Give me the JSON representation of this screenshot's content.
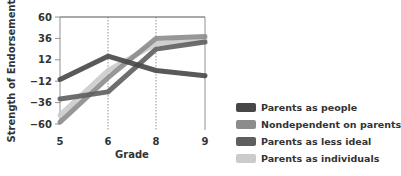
{
  "chart_data": {
    "type": "line",
    "title": "",
    "xlabel": "Grade",
    "ylabel": "Strength of Endorsement",
    "categories": [
      "5",
      "6",
      "8",
      "9"
    ],
    "y_ticks": [
      60,
      36,
      12,
      -12,
      -36,
      -60
    ],
    "ylim": [
      -60,
      60
    ],
    "grid": "vertical dotted lines at grades 6 and 8",
    "legend_position": "right-bottom",
    "series": [
      {
        "name": "Parents as people",
        "color": "#474747",
        "values": [
          -10,
          16,
          0,
          -6
        ]
      },
      {
        "name": "Nondependent on parents",
        "color": "#8c8c8c",
        "values": [
          -58,
          -8,
          36,
          38
        ]
      },
      {
        "name": "Parents as less ideal",
        "color": "#5e5e5e",
        "values": [
          -32,
          -24,
          24,
          32
        ]
      },
      {
        "name": "Parents as individuals",
        "color": "#cbcbcb",
        "values": [
          -50,
          0,
          30,
          34
        ]
      }
    ]
  },
  "legend": {
    "items": [
      {
        "label": "Parents as people",
        "color": "#474747"
      },
      {
        "label": "Nondependent on parents",
        "color": "#8c8c8c"
      },
      {
        "label": "Parents as less ideal",
        "color": "#5e5e5e"
      },
      {
        "label": "Parents as individuals",
        "color": "#cbcbcb"
      }
    ]
  }
}
